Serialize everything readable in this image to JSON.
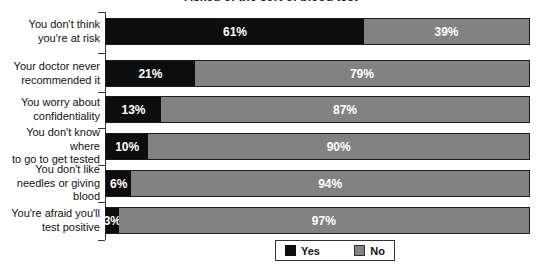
{
  "chart_data": {
    "type": "bar",
    "orientation": "horizontal-stacked",
    "title_partial": "Asked of the sort of blood test",
    "categories": [
      "You don't think\nyou're at risk",
      "Your doctor never\nrecommended it",
      "You worry about\nconfidentiality",
      "You don't know where\nto go to get tested",
      "You don't like\nneedles or giving blood",
      "You're afraid you'll\ntest positive"
    ],
    "series": [
      {
        "name": "Yes",
        "color": "#0d0d0d",
        "values": [
          61,
          21,
          13,
          10,
          6,
          3
        ]
      },
      {
        "name": "No",
        "color": "#828282",
        "values": [
          39,
          79,
          87,
          90,
          94,
          97
        ]
      }
    ],
    "value_label_format": "{v}%",
    "xlim": [
      0,
      100
    ],
    "legend_position": "bottom",
    "grid": false
  }
}
